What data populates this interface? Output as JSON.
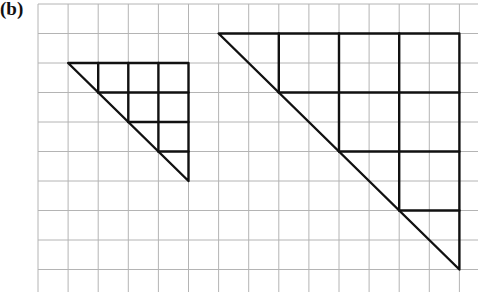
{
  "figure": {
    "label": "(b)",
    "grid": {
      "origin_x": 38,
      "origin_y": 4,
      "cell_w": 30.1,
      "cell_h": 29.5,
      "cols": 15,
      "rows": 10,
      "line_color": "#b4b4b4"
    },
    "shapes": [
      {
        "name": "small-triangle",
        "description": "Right triangle 4 cells wide by 4 cells tall, subdivided into unit grid squares",
        "top_left_cell": [
          1,
          2
        ],
        "size_cells": 4,
        "subdivision_cells": 1
      },
      {
        "name": "large-triangle",
        "description": "Right triangle 8 cells wide by 8 cells tall, subdivided into 2x2-cell squares",
        "top_left_cell": [
          6,
          1
        ],
        "size_cells": 8,
        "subdivision_cells": 2
      }
    ],
    "stroke_color": "#111111"
  }
}
